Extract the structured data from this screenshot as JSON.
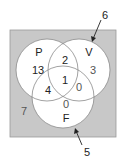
{
  "diagram": {
    "type": "venn",
    "colors": {
      "universe": "#c8c8c8",
      "circle_fill": "#ffffff",
      "stroke": "#8a8a8a",
      "text": "#222222"
    },
    "sets": [
      {
        "name": "P"
      },
      {
        "name": "V"
      },
      {
        "name": "F"
      }
    ],
    "regions": {
      "P_only": "13",
      "V_only": "3",
      "F_only": "0",
      "P_and_V_only": "2",
      "P_and_F_only": "4",
      "V_and_F_only": "0",
      "P_and_V_and_F": "1",
      "outside": "7"
    },
    "callouts": [
      {
        "label": "6",
        "points_to": "V circle boundary"
      },
      {
        "label": "5",
        "points_to": "F circle boundary"
      }
    ]
  }
}
